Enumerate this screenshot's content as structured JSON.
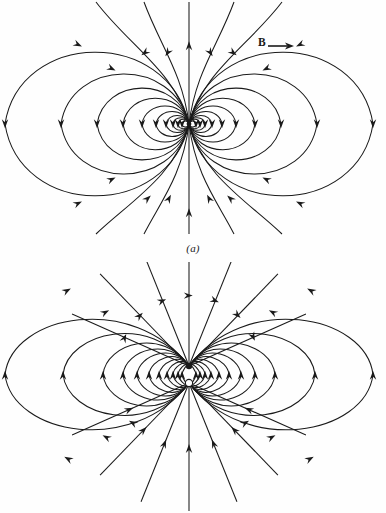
{
  "document": {
    "title": "Dipole field line diagrams",
    "background_color": "#fefefe",
    "line_color": "#1a1a1a"
  },
  "figures": [
    {
      "id": "a",
      "caption": "(a)",
      "field_symbol": "B",
      "field_name": "magnetic-field",
      "description": "Magnetic dipole field lines forming closed loops about a point dipole",
      "center": {
        "x": 189,
        "y": 124
      },
      "source_type": "point-dipole",
      "poles": [
        {
          "kind": "dipole-point",
          "x": 189,
          "y": 124,
          "fill": "#1a1a1a"
        }
      ]
    },
    {
      "id": "b",
      "caption": "(b)",
      "field_symbol": "E",
      "field_name": "electric-field",
      "description": "Electric dipole field lines running from positive charge to negative charge",
      "center": {
        "x": 189,
        "y": 374
      },
      "source_type": "two-charge-dipole",
      "poles": [
        {
          "kind": "negative-charge",
          "x": 189,
          "y": 366,
          "fill": "#1a1a1a"
        },
        {
          "kind": "positive-charge",
          "x": 189,
          "y": 383,
          "fill": "#ffffff"
        }
      ]
    }
  ],
  "chart_data": {
    "type": "line",
    "xlabel": "",
    "ylabel": "",
    "panels": [
      {
        "label": "(a)",
        "symbol": "B",
        "kind": "magnetic dipole",
        "center": [
          189,
          124
        ],
        "closed_loop_half_widths": [
          184,
          128,
          92,
          66,
          47,
          33,
          23,
          16,
          11,
          7
        ],
        "closed_loop_half_heights": [
          92,
          64,
          46,
          33,
          23,
          16,
          11,
          8,
          6,
          4
        ],
        "axis_line_angles_deg": [
          90,
          70,
          50,
          110,
          130,
          270,
          250,
          230,
          290,
          310
        ],
        "arrow_count_per_loop": 2,
        "notes": "All loops converge on a single point; vertical axis line is straight through the centre with arrows pointing up"
      },
      {
        "label": "(b)",
        "symbol": "E",
        "kind": "electric dipole",
        "charge_separation_px": 17,
        "negative_charge": [
          189,
          366
        ],
        "positive_charge": [
          189,
          383
        ],
        "closed_loop_half_widths": [
          184,
          126,
          86,
          66,
          52,
          40,
          30,
          22,
          16,
          11,
          7
        ],
        "closed_loop_half_heights": [
          84,
          60,
          44,
          34,
          27,
          21,
          16,
          12,
          9,
          6,
          4
        ],
        "radial_line_angles_deg": [
          90,
          65,
          40,
          115,
          140,
          270,
          245,
          220,
          295,
          320
        ],
        "arrow_count_per_loop": 2,
        "notes": "Field lines leave the open (positive) charge and enter the filled (negative) charge"
      }
    ],
    "legend": [
      "B",
      "E"
    ],
    "grid": false
  }
}
